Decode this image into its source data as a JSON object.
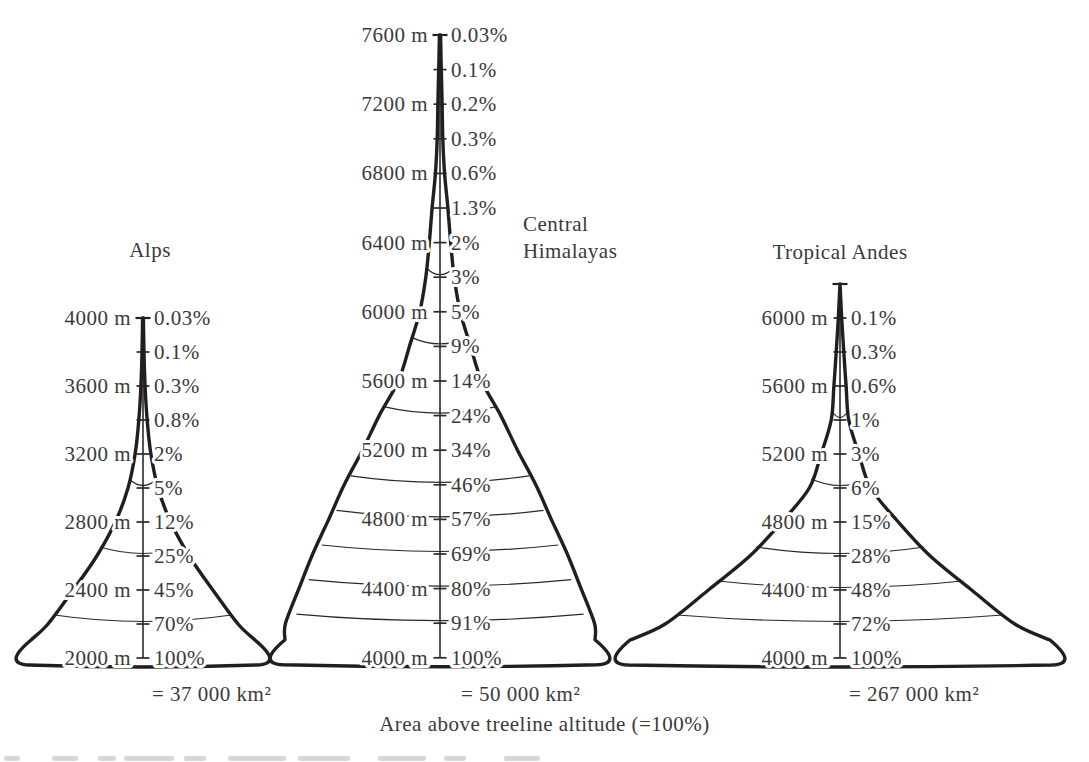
{
  "page": {
    "caption": "Area above treeline altitude (=100%)",
    "background": "#ffffff",
    "line_color": "#1f1f1f",
    "text_color": "#3a3a3a"
  },
  "chart_data": [
    {
      "id": "alps",
      "type": "area",
      "title": "Alps",
      "total_area_label": "= 37 000 km²",
      "total_area_km2": 37000,
      "altitude_step_m": 200,
      "altitude_top_m": 4000,
      "altitude_base_m": 2000,
      "levels": [
        {
          "altitude_m": 4000,
          "altitude_label": "4000 m",
          "percent": 0.03,
          "percent_label": "0.03%",
          "contour_arc": false
        },
        {
          "altitude_m": 3800,
          "altitude_label": "",
          "percent": 0.1,
          "percent_label": "0.1%",
          "contour_arc": false
        },
        {
          "altitude_m": 3600,
          "altitude_label": "3600 m",
          "percent": 0.3,
          "percent_label": "0.3%",
          "contour_arc": false
        },
        {
          "altitude_m": 3400,
          "altitude_label": "",
          "percent": 0.8,
          "percent_label": "0.8%",
          "contour_arc": false
        },
        {
          "altitude_m": 3200,
          "altitude_label": "3200 m",
          "percent": 2,
          "percent_label": "2%",
          "contour_arc": false
        },
        {
          "altitude_m": 3000,
          "altitude_label": "",
          "percent": 5,
          "percent_label": "5%",
          "contour_arc": true
        },
        {
          "altitude_m": 2800,
          "altitude_label": "2800 m",
          "percent": 12,
          "percent_label": "12%",
          "contour_arc": false
        },
        {
          "altitude_m": 2600,
          "altitude_label": "",
          "percent": 25,
          "percent_label": "25%",
          "contour_arc": true
        },
        {
          "altitude_m": 2400,
          "altitude_label": "2400 m",
          "percent": 45,
          "percent_label": "45%",
          "contour_arc": false
        },
        {
          "altitude_m": 2200,
          "altitude_label": "",
          "percent": 70,
          "percent_label": "70%",
          "contour_arc": true
        },
        {
          "altitude_m": 2000,
          "altitude_label": "2000 m",
          "percent": 100,
          "percent_label": "100%",
          "contour_arc": false
        }
      ]
    },
    {
      "id": "himalayas",
      "type": "area",
      "title": "Central\nHimalayas",
      "total_area_label": "= 50 000 km²",
      "total_area_km2": 50000,
      "altitude_step_m": 200,
      "altitude_top_m": 7600,
      "altitude_base_m": 4000,
      "levels": [
        {
          "altitude_m": 7600,
          "altitude_label": "7600 m",
          "percent": 0.03,
          "percent_label": "0.03%",
          "contour_arc": false
        },
        {
          "altitude_m": 7400,
          "altitude_label": "",
          "percent": 0.1,
          "percent_label": "0.1%",
          "contour_arc": false
        },
        {
          "altitude_m": 7200,
          "altitude_label": "7200 m",
          "percent": 0.2,
          "percent_label": "0.2%",
          "contour_arc": false
        },
        {
          "altitude_m": 7000,
          "altitude_label": "",
          "percent": 0.3,
          "percent_label": "0.3%",
          "contour_arc": false
        },
        {
          "altitude_m": 6800,
          "altitude_label": "6800 m",
          "percent": 0.6,
          "percent_label": "0.6%",
          "contour_arc": false
        },
        {
          "altitude_m": 6600,
          "altitude_label": "",
          "percent": 1.3,
          "percent_label": "1.3%",
          "contour_arc": false
        },
        {
          "altitude_m": 6400,
          "altitude_label": "6400 m",
          "percent": 2,
          "percent_label": "2%",
          "contour_arc": false
        },
        {
          "altitude_m": 6200,
          "altitude_label": "",
          "percent": 3,
          "percent_label": "3%",
          "contour_arc": true
        },
        {
          "altitude_m": 6000,
          "altitude_label": "6000 m",
          "percent": 5,
          "percent_label": "5%",
          "contour_arc": false
        },
        {
          "altitude_m": 5800,
          "altitude_label": "",
          "percent": 9,
          "percent_label": "9%",
          "contour_arc": true
        },
        {
          "altitude_m": 5600,
          "altitude_label": "5600 m",
          "percent": 14,
          "percent_label": "14%",
          "contour_arc": false
        },
        {
          "altitude_m": 5400,
          "altitude_label": "",
          "percent": 24,
          "percent_label": "24%",
          "contour_arc": true
        },
        {
          "altitude_m": 5200,
          "altitude_label": "5200 m",
          "percent": 34,
          "percent_label": "34%",
          "contour_arc": false
        },
        {
          "altitude_m": 5000,
          "altitude_label": "",
          "percent": 46,
          "percent_label": "46%",
          "contour_arc": true
        },
        {
          "altitude_m": 4800,
          "altitude_label": "4800 m",
          "percent": 57,
          "percent_label": "57%",
          "contour_arc": true
        },
        {
          "altitude_m": 4600,
          "altitude_label": "",
          "percent": 69,
          "percent_label": "69%",
          "contour_arc": true
        },
        {
          "altitude_m": 4400,
          "altitude_label": "4400 m",
          "percent": 80,
          "percent_label": "80%",
          "contour_arc": true
        },
        {
          "altitude_m": 4200,
          "altitude_label": "",
          "percent": 91,
          "percent_label": "91%",
          "contour_arc": true
        },
        {
          "altitude_m": 4000,
          "altitude_label": "4000 m",
          "percent": 100,
          "percent_label": "100%",
          "contour_arc": false
        }
      ]
    },
    {
      "id": "andes",
      "type": "area",
      "title": "Tropical Andes",
      "total_area_label": "= 267 000 km²",
      "total_area_km2": 267000,
      "altitude_step_m": 200,
      "altitude_top_m": 6200,
      "altitude_base_m": 4000,
      "levels": [
        {
          "altitude_m": 6200,
          "altitude_label": "",
          "percent": null,
          "percent_label": "",
          "contour_arc": false
        },
        {
          "altitude_m": 6000,
          "altitude_label": "6000 m",
          "percent": 0.1,
          "percent_label": "0.1%",
          "contour_arc": false
        },
        {
          "altitude_m": 5800,
          "altitude_label": "",
          "percent": 0.3,
          "percent_label": "0.3%",
          "contour_arc": false
        },
        {
          "altitude_m": 5600,
          "altitude_label": "5600 m",
          "percent": 0.6,
          "percent_label": "0.6%",
          "contour_arc": false
        },
        {
          "altitude_m": 5400,
          "altitude_label": "",
          "percent": 1,
          "percent_label": "1%",
          "contour_arc": true
        },
        {
          "altitude_m": 5200,
          "altitude_label": "5200 m",
          "percent": 3,
          "percent_label": "3%",
          "contour_arc": false
        },
        {
          "altitude_m": 5000,
          "altitude_label": "",
          "percent": 6,
          "percent_label": "6%",
          "contour_arc": true
        },
        {
          "altitude_m": 4800,
          "altitude_label": "4800 m",
          "percent": 15,
          "percent_label": "15%",
          "contour_arc": false
        },
        {
          "altitude_m": 4600,
          "altitude_label": "",
          "percent": 28,
          "percent_label": "28%",
          "contour_arc": true
        },
        {
          "altitude_m": 4400,
          "altitude_label": "4400 m",
          "percent": 48,
          "percent_label": "48%",
          "contour_arc": true
        },
        {
          "altitude_m": 4200,
          "altitude_label": "",
          "percent": 72,
          "percent_label": "72%",
          "contour_arc": true
        },
        {
          "altitude_m": 4000,
          "altitude_label": "4000 m",
          "percent": 100,
          "percent_label": "100%",
          "contour_arc": false
        }
      ]
    }
  ]
}
